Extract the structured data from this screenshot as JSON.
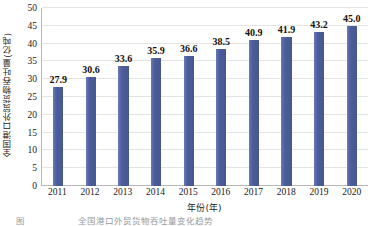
{
  "chart_data": {
    "type": "bar",
    "title": "",
    "xlabel": "年份(年)",
    "ylabel": "全国港口外贸货物吞吐量(亿吨)",
    "categories": [
      "2011",
      "2012",
      "2013",
      "2014",
      "2015",
      "2016",
      "2017",
      "2018",
      "2019",
      "2020"
    ],
    "values": [
      27.9,
      30.6,
      33.6,
      35.9,
      36.6,
      38.5,
      40.9,
      41.9,
      43.2,
      45.0
    ],
    "value_labels": [
      "27.9",
      "30.6",
      "33.6",
      "35.9",
      "36.6",
      "38.5",
      "40.9",
      "41.9",
      "43.2",
      "45.0"
    ],
    "ylim": [
      0,
      50
    ],
    "ytick_values": [
      0,
      5,
      10,
      15,
      20,
      25,
      30,
      35,
      40,
      45,
      50
    ],
    "ytick_labels": [
      "0",
      "5",
      "10",
      "15",
      "20",
      "25",
      "30",
      "35",
      "40",
      "45",
      "50"
    ],
    "grid": true,
    "grid_orientation": "horizontal",
    "legend": false,
    "series_color": "#4c5d9c"
  },
  "colors": {
    "bar": "#4c5d9c",
    "bar_light": "#6b7ab5",
    "bar_dark": "#47578f",
    "grid": "#e4e4e4",
    "axis": "#b9b9b9",
    "text": "#1a1a1a",
    "background": "#ffffff",
    "caption": "#9a9a9a"
  },
  "caption": {
    "figure_mark": "图",
    "text": "全国港口外贸货物吞吐量变化趋势"
  }
}
